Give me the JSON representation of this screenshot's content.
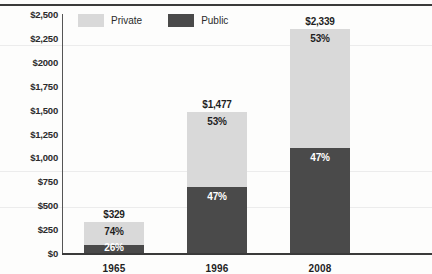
{
  "chart_data": {
    "type": "bar",
    "stacked": true,
    "title": "",
    "xlabel": "",
    "ylabel": "",
    "categories": [
      "1965",
      "1996",
      "2008"
    ],
    "totals": [
      "$329",
      "$1,477",
      "$2,339"
    ],
    "total_values": [
      329,
      1477,
      2339
    ],
    "ylim": [
      0,
      2500
    ],
    "grid": false,
    "legend_position": "top-left",
    "ytick_labels": [
      "$2,500",
      "$2,250",
      "$2000",
      "$1,750",
      "$1,500",
      "$1,250",
      "$1,000",
      "$750",
      "$500",
      "$250",
      "$0"
    ],
    "ytick_values": [
      2500,
      2250,
      2000,
      1750,
      1500,
      1250,
      1000,
      750,
      500,
      250,
      0
    ],
    "series": [
      {
        "name": "Private",
        "color": "#d9d9d9",
        "percent_labels": [
          "74%",
          "53%",
          "53%"
        ],
        "percents": [
          74,
          53,
          53
        ],
        "values": [
          243,
          783,
          1240
        ]
      },
      {
        "name": "Public",
        "color": "#4a4a4a",
        "percent_labels": [
          "26%",
          "47%",
          "47%"
        ],
        "percents": [
          26,
          47,
          47
        ],
        "values": [
          86,
          694,
          1099
        ]
      }
    ]
  },
  "legend": {
    "items": [
      {
        "label": "Private",
        "color": "#d9d9d9"
      },
      {
        "label": "Public",
        "color": "#4a4a4a"
      }
    ]
  }
}
